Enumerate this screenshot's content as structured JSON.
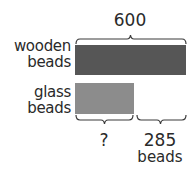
{
  "diagram": {
    "type": "tape-diagram",
    "total_label": "600",
    "rows": [
      {
        "label_line1": "wooden",
        "label_line2": "beads",
        "color": "#565656"
      },
      {
        "label_line1": "glass",
        "label_line2": "beads",
        "color": "#8c8c8c"
      }
    ],
    "bottom_parts": [
      {
        "label": "?"
      },
      {
        "label_line1": "285",
        "label_line2": "beads"
      }
    ],
    "brace_color": "#3a3a3a"
  }
}
